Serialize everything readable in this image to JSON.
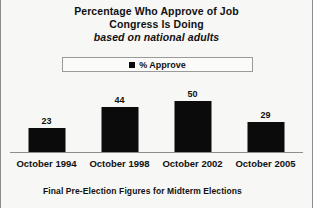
{
  "chart_data": {
    "type": "bar",
    "title": "Percentage Who Approve of Job Congress Is Doing",
    "title_lines": [
      "Percentage Who Approve of Job",
      "Congress Is Doing"
    ],
    "subtitle": "based on national adults",
    "footer": "Final Pre-Election Figures for Midterm Elections",
    "categories": [
      "October 1994",
      "October 1998",
      "October 2002",
      "October 2005"
    ],
    "values": [
      23,
      44,
      50,
      29
    ],
    "series": [
      {
        "name": "% Approve",
        "values": [
          23,
          44,
          50,
          29
        ]
      }
    ],
    "legend": {
      "position": "top",
      "entries": [
        "% Approve"
      ],
      "swatch_icon": "filled-square-marker"
    },
    "xlabel": "",
    "ylabel": "",
    "ylim": [
      0,
      70
    ],
    "grid": false,
    "axis_visible": "x-baseline-only",
    "bar_color": "#0b0b0b",
    "background_color": "#f7f7f5",
    "frame_color": "#8d8d8d"
  }
}
